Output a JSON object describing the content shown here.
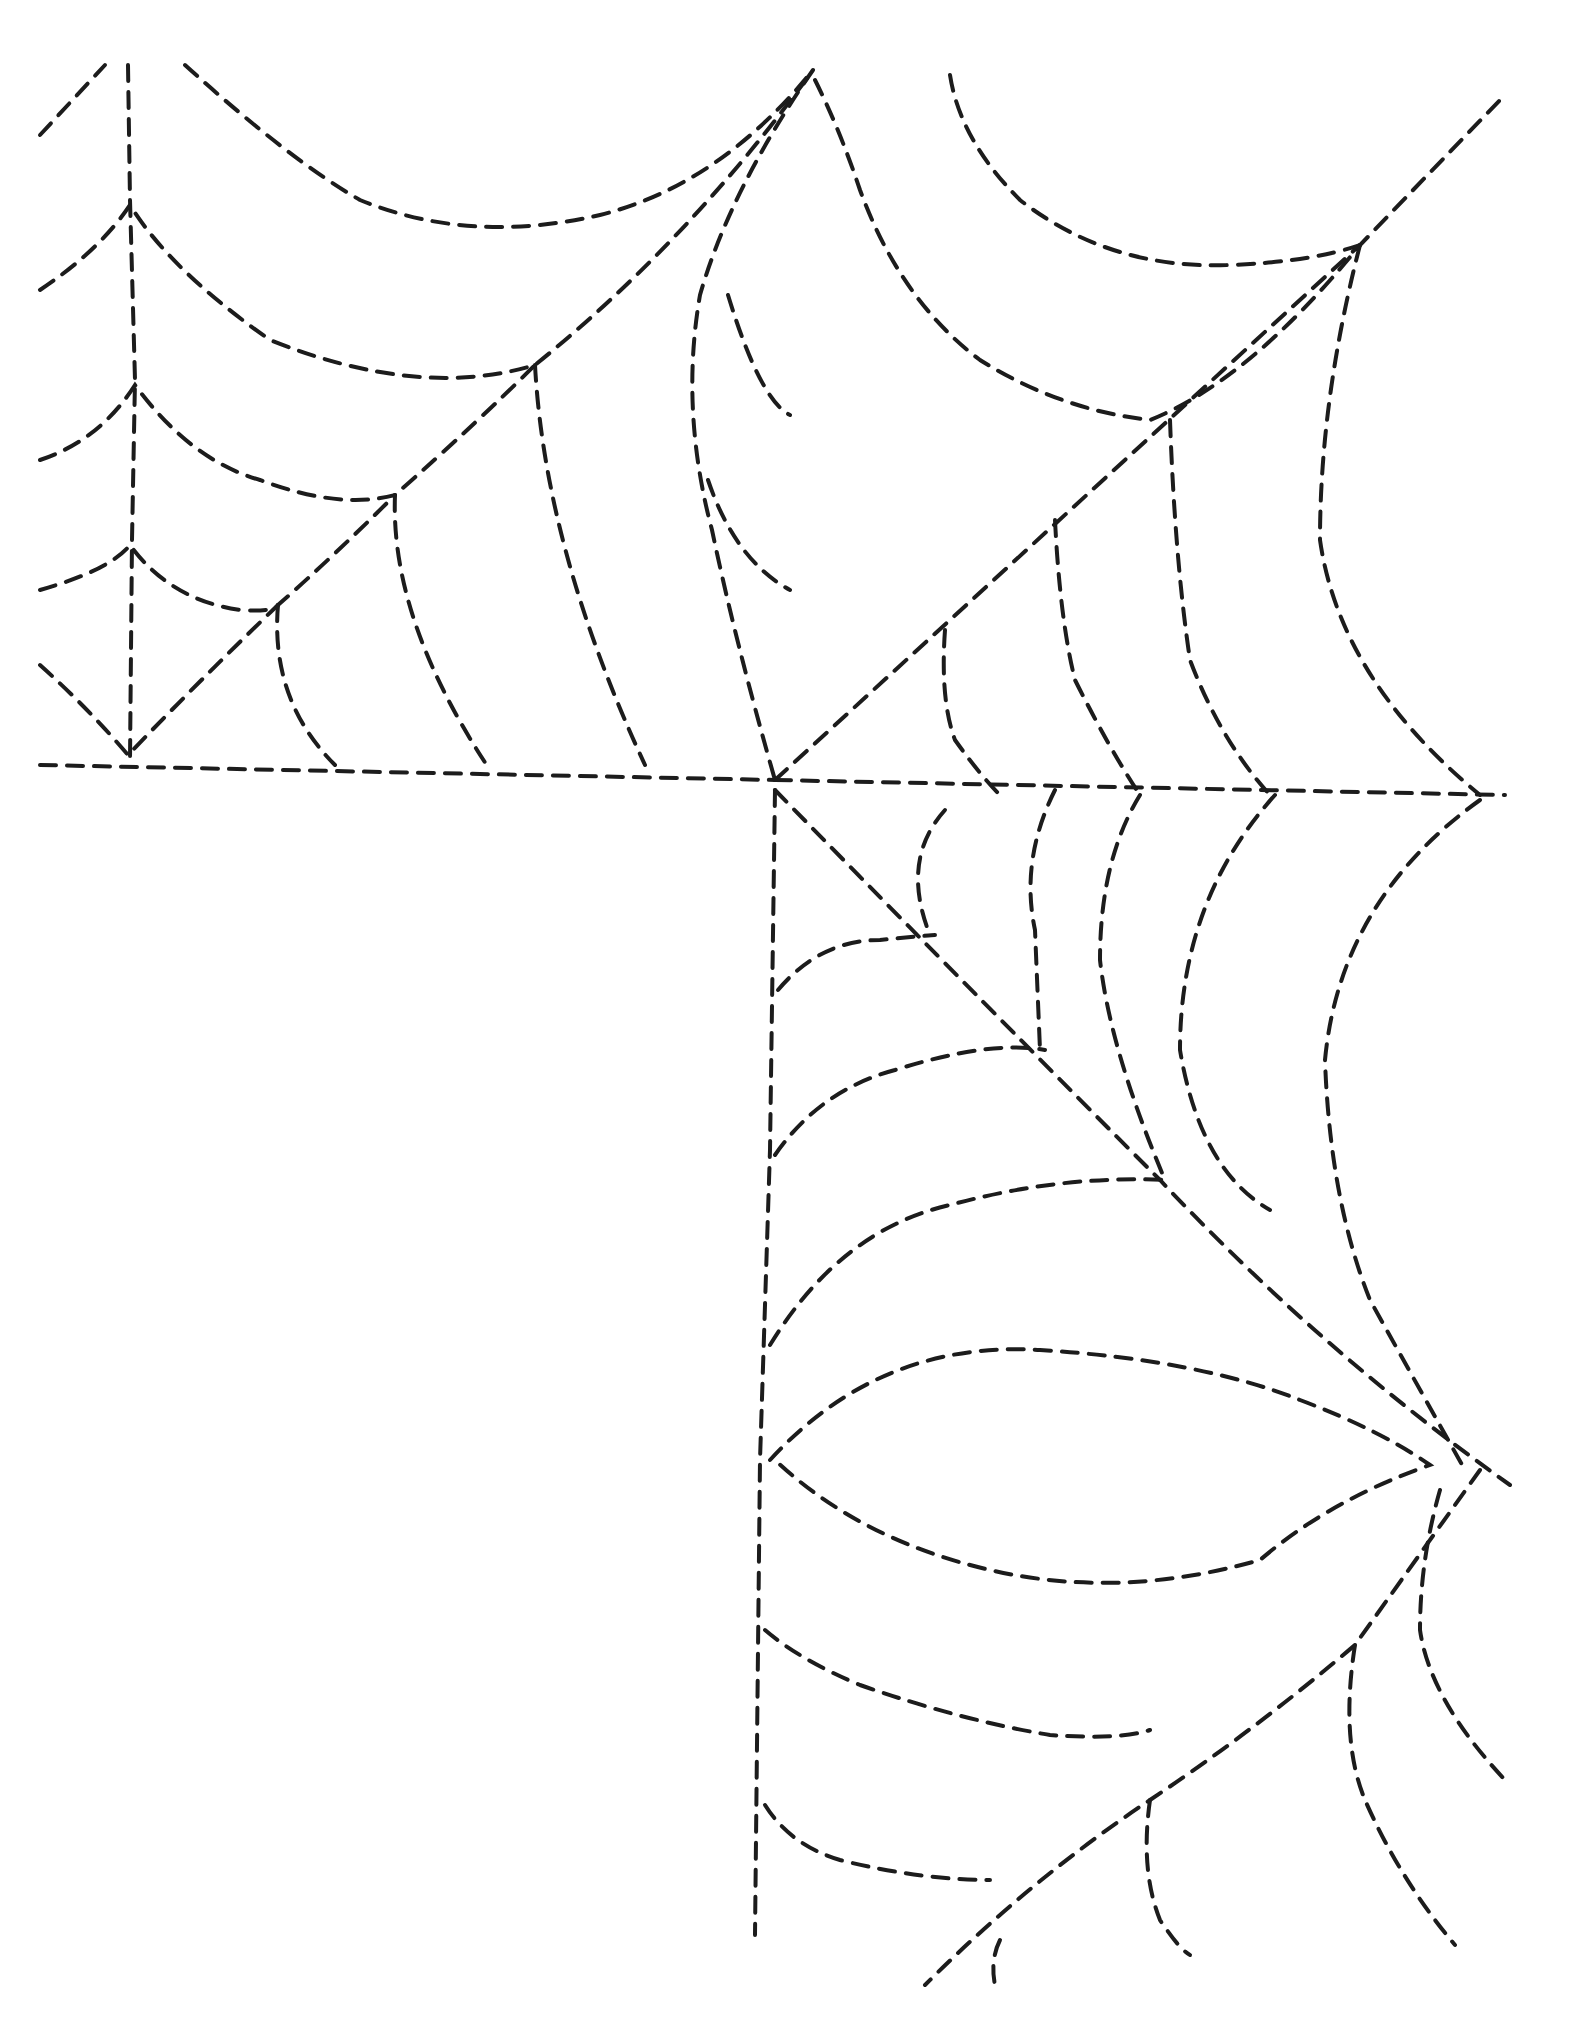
{
  "artwork": {
    "subject": "spider web dashed tracing",
    "stroke_color": "#1c1c1c",
    "background": "#ffffff",
    "webs": [
      {
        "name": "upper-left-web",
        "paths": [
          "M 40 135 L 105 65",
          "M 128 65 L 130 200 L 135 380 L 132 540 L 130 760",
          "M 185 65 Q 290 160 360 200 Q 470 245 600 215 Q 720 185 813 70",
          "M 40 290 Q 100 250 130 205 Q 170 270 270 340 Q 420 400 535 365 Q 690 240 813 70",
          "M 40 460 Q 100 440 135 385 Q 190 460 260 480 Q 340 510 395 495 Q 480 420 535 365",
          "M 40 590 Q 110 570 130 545 Q 170 600 240 610 Q 275 612 278 605 Q 335 555 395 495",
          "M 40 665 Q 90 710 128 755 Q 200 680 278 605",
          "M 278 605 Q 270 700 335 765",
          "M 395 495 Q 390 620 490 770",
          "M 535 365 Q 545 550 645 765",
          "M 40 765 L 775 780",
          "M 813 70 Q 730 190 700 295 Q 680 410 712 530 Q 735 640 775 780",
          "M 728 295 Q 760 400 790 415",
          "M 708 480 Q 735 560 790 590"
        ]
      },
      {
        "name": "upper-right-web",
        "paths": [
          "M 815 80 Q 840 130 860 190 Q 900 300 980 360 Q 1060 410 1150 420 Q 1250 380 1360 245 L 1500 100",
          "M 950 75 Q 960 140 1020 200 Q 1110 270 1230 265 Q 1310 262 1360 245",
          "M 775 780 L 1360 245",
          "M 1360 245 Q 1320 400 1320 540 Q 1340 680 1480 795",
          "M 1170 420 Q 1175 560 1190 660 Q 1220 740 1270 795",
          "M 1055 520 Q 1060 620 1075 680 Q 1110 750 1140 795",
          "M 945 630 Q 940 700 955 740 Q 980 775 1000 795",
          "M 775 780 L 1505 795"
        ]
      },
      {
        "name": "lower-right-web",
        "paths": [
          "M 775 790 L 770 1150 L 760 1460 L 755 1935",
          "M 775 790 Q 1000 1020 1160 1180 Q 1320 1350 1510 1485",
          "M 945 810 Q 900 860 930 935",
          "M 1055 790 Q 1020 860 1035 930 L 1040 1050",
          "M 1140 795 Q 1100 860 1100 960 Q 1110 1050 1165 1180",
          "M 1275 795 Q 1180 900 1180 1050 Q 1200 1170 1270 1210",
          "M 1480 800 Q 1340 900 1325 1060 Q 1330 1200 1370 1300 Q 1420 1390 1465 1470",
          "M 778 990 Q 820 940 880 940 Q 930 935 935 935",
          "M 775 1155 Q 820 1090 895 1070 Q 990 1040 1045 1050",
          "M 770 1345 Q 840 1230 950 1205 Q 1060 1175 1165 1180",
          "M 770 1460 Q 880 1340 1040 1350 Q 1200 1360 1300 1400 Q 1380 1430 1430 1465 Q 1330 1500 1260 1560 Q 1120 1600 990 1570 Q 860 1540 775 1460",
          "M 1480 1470 Q 1430 1540 1355 1645 Q 1255 1730 1150 1800 Q 1030 1880 925 1985",
          "M 1440 1490 Q 1420 1560 1420 1630 Q 1430 1700 1505 1780",
          "M 1355 1645 Q 1340 1740 1365 1800 Q 1400 1880 1455 1945",
          "M 1150 1800 Q 1140 1870 1160 1920 Q 1180 1950 1190 1955",
          "M 1000 1940 Q 990 1960 995 1985",
          "M 765 1630 Q 800 1660 860 1685 Q 960 1720 1050 1735 Q 1120 1740 1150 1730",
          "M 765 1805 Q 790 1845 840 1860 Q 920 1880 990 1880"
        ]
      }
    ]
  }
}
